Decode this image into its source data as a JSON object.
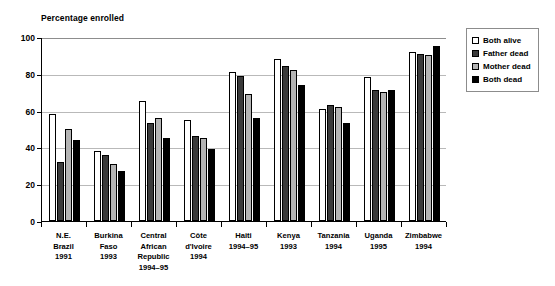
{
  "chart_data": {
    "type": "bar",
    "title": "Percentage enrolled",
    "xlabel": "",
    "ylabel": "",
    "ylim": [
      0,
      100
    ],
    "yticks": [
      0,
      20,
      40,
      60,
      80,
      100
    ],
    "grid": true,
    "legend_position": "right",
    "categories": [
      "N.E.\nBrazil\n1991",
      "Burkina\nFaso\n1993",
      "Central\nAfrican\nRepublic\n1994–95",
      "Côte\nd'Ivoire\n1994",
      "Haiti\n1994–95",
      "Kenya\n1993",
      "Tanzania\n1994",
      "Uganda\n1995",
      "Zimbabwe\n1994"
    ],
    "series": [
      {
        "name": "Both alive",
        "color": "#ffffff",
        "values": [
          58,
          38,
          65,
          55,
          81,
          88,
          61,
          78,
          92
        ]
      },
      {
        "name": "Father dead",
        "color": "#3a3a3a",
        "values": [
          32,
          36,
          53,
          46,
          79,
          84,
          63,
          71,
          91
        ]
      },
      {
        "name": "Mother dead",
        "color": "#b4b4b4",
        "values": [
          50,
          31,
          56,
          45,
          69,
          82,
          62,
          70,
          90
        ]
      },
      {
        "name": "Both dead",
        "color": "#000000",
        "values": [
          44,
          27,
          45,
          39,
          56,
          74,
          53,
          71,
          95
        ]
      }
    ]
  },
  "legend": {
    "items": [
      {
        "label": "Both alive"
      },
      {
        "label": "Father dead"
      },
      {
        "label": "Mother dead"
      },
      {
        "label": "Both dead"
      }
    ]
  }
}
